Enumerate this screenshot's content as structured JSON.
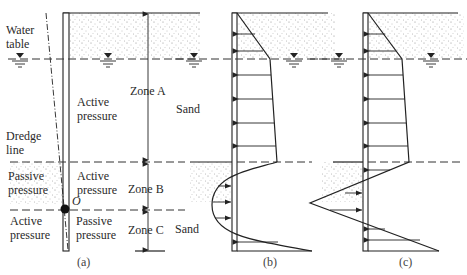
{
  "figure": {
    "panels": {
      "a": {
        "caption": "(a)",
        "labels": {
          "water_table_line1": "Water",
          "water_table_line2": "table",
          "dredge_line1": "Dredge",
          "dredge_line2": "line",
          "active_upper_line1": "Active",
          "active_upper_line2": "pressure",
          "active_mid_line1": "Active",
          "active_mid_line2": "pressure",
          "passive_left_line1": "Passive",
          "passive_left_line2": "pressure",
          "active_lower_line1": "Active",
          "active_lower_line2": "pressure",
          "passive_lower_line1": "Passive",
          "passive_lower_line2": "pressure",
          "pivot": "O",
          "zone_a": "Zone A",
          "zone_b": "Zone B",
          "zone_c": "Zone C",
          "sand_upper": "Sand",
          "sand_lower": "Sand"
        }
      },
      "b": {
        "caption": "(b)"
      },
      "c": {
        "caption": "(c)"
      }
    },
    "symbols": {
      "water_table_marker": "inverted-triangle-icon"
    },
    "colors": {
      "ink": "#222222",
      "sand_dots": "#666666",
      "background": "#ffffff"
    }
  }
}
